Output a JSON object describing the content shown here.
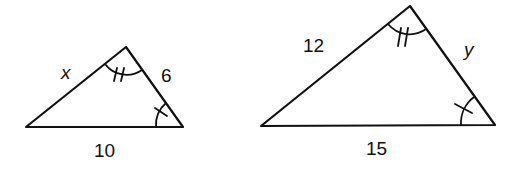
{
  "diagram": {
    "colors": {
      "stroke": "#111111",
      "background": "#ffffff"
    },
    "triangles": [
      {
        "name": "small-triangle",
        "sides": {
          "left": "x",
          "right": "6",
          "base": "10"
        },
        "angle_marks": {
          "apex": "double-tick arc",
          "bottom_right": "single-tick arc"
        }
      },
      {
        "name": "large-triangle",
        "sides": {
          "left": "12",
          "right": "y",
          "base": "15"
        },
        "angle_marks": {
          "apex": "double-tick arc",
          "bottom_right": "single-tick arc"
        }
      }
    ]
  }
}
